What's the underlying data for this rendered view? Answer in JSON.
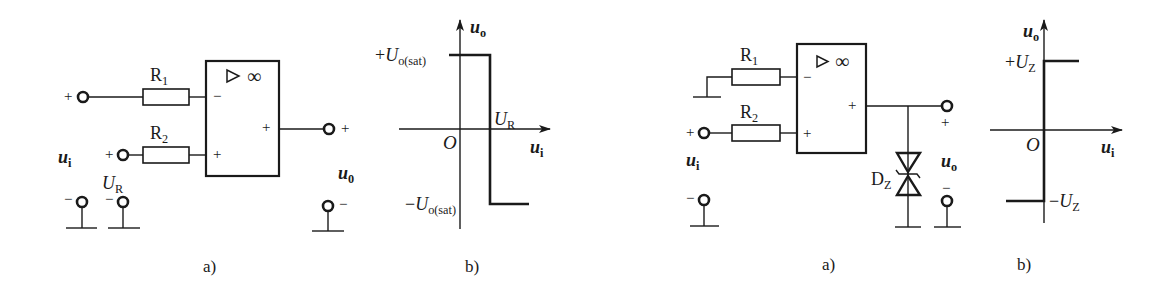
{
  "figure_left": {
    "circuit_a": {
      "caption": "a)",
      "opamp_symbol": "▷ ∞",
      "opamp_inputs": {
        "inverting": "−",
        "noninverting": "+"
      },
      "opamp_output_sign": "+",
      "resistors": [
        {
          "name": "R",
          "sub": "1"
        },
        {
          "name": "R",
          "sub": "2"
        }
      ],
      "input_label": {
        "main": "u",
        "sub": "i"
      },
      "reference_label": {
        "main": "U",
        "sub": "R"
      },
      "output_label": {
        "main": "u",
        "sub": "0"
      },
      "terminal_signs": {
        "input_plus": "+",
        "input_minus": "−",
        "ref_plus": "+",
        "ref_minus": "−",
        "out_plus": "+",
        "out_minus": "−"
      }
    },
    "graph_b": {
      "caption": "b)",
      "y_axis_label": {
        "main": "u",
        "sub": "o"
      },
      "x_axis_label": {
        "main": "u",
        "sub": "i"
      },
      "origin": "O",
      "top_level": {
        "prefix": "+",
        "main": "U",
        "sub": "o(sat)"
      },
      "bottom_level": {
        "prefix": "−",
        "main": "U",
        "sub": "o(sat)"
      },
      "threshold": {
        "main": "U",
        "sub": "R"
      }
    }
  },
  "figure_right": {
    "circuit_a": {
      "caption": "a)",
      "opamp_symbol": "▷ ∞",
      "opamp_inputs": {
        "inverting": "−",
        "noninverting": "+"
      },
      "opamp_output_sign": "+",
      "resistors": [
        {
          "name": "R",
          "sub": "1"
        },
        {
          "name": "R",
          "sub": "2"
        }
      ],
      "input_label": {
        "main": "u",
        "sub": "i"
      },
      "output_label": {
        "main": "u",
        "sub": "o"
      },
      "zener_label": {
        "main": "D",
        "sub": "Z"
      },
      "terminal_signs": {
        "input_plus": "+",
        "input_minus": "−",
        "out_plus": "+",
        "out_minus": "−"
      }
    },
    "graph_b": {
      "caption": "b)",
      "y_axis_label": {
        "main": "u",
        "sub": "o"
      },
      "x_axis_label": {
        "main": "u",
        "sub": "i"
      },
      "origin": "O",
      "top_level": {
        "prefix": "+",
        "main": "U",
        "sub": "Z"
      },
      "bottom_level": {
        "prefix": "−",
        "main": "U",
        "sub": "Z"
      }
    }
  }
}
